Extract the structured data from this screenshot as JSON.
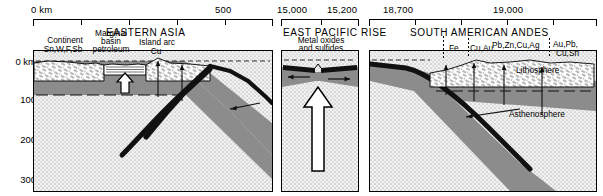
{
  "figure": {
    "type": "geologic-cross-section"
  },
  "axes": {
    "depth_unit_label": "0 km",
    "depth_ticks": [
      "0 km",
      "100",
      "200",
      "300"
    ],
    "depth_values": [
      0,
      100,
      200,
      300
    ]
  },
  "panels": [
    {
      "id": "eastern-asia",
      "title": "EASTERN ASIA",
      "scale": {
        "left_label": "0 km",
        "right_label": "500",
        "ticks": 6
      },
      "features": [
        {
          "name": "continent",
          "label": "Continent",
          "minerals": "Sn,W,F,Sb"
        },
        {
          "name": "marginal-basin",
          "label": "Marginal\nbasin",
          "resource": "petroleum"
        },
        {
          "name": "island-arc",
          "label": "Island arc",
          "minerals": "Cu"
        }
      ],
      "labels": {
        "continent": "Continent",
        "continent_minerals": "Sn,W,F,Sb",
        "marginal_basin_line1": "Marginal",
        "marginal_basin_line2": "basin",
        "marginal_basin_line3": "petroleum",
        "island_arc": "Island arc",
        "island_arc_minerals": "Cu"
      }
    },
    {
      "id": "east-pacific-rise",
      "title": "EAST PACIFIC RISE",
      "scale": {
        "left_label": "15,000",
        "right_label": "15,200",
        "ticks": 2
      },
      "labels": {
        "deposit_line1": "Metal oxides",
        "deposit_line2": "and sulfides"
      }
    },
    {
      "id": "south-american-andes",
      "title": "SOUTH AMERICAN ANDES",
      "scale": {
        "left_label": "18,700",
        "right_label": "19,000",
        "ticks": 5
      },
      "labels": {
        "fe": "Fe",
        "cu_au": "Cu,Au",
        "pb_zn_cu_ag": "Pb,Zn,Cu,Ag",
        "au_pb_line1": "Au,Pb,",
        "au_pb_line2": "Cu,Sn",
        "lithosphere": "Lithosphere",
        "asthenosphere": "Asthenosphere"
      }
    }
  ],
  "colors": {
    "ink": "#000000",
    "mantle_gray": "#8c8c8c",
    "asthenosphere_stipple": "#e8e8e8",
    "crust_white": "#ffffff",
    "ocean_black": "#111111"
  }
}
